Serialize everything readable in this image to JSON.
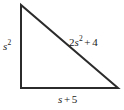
{
  "figure": {
    "kind": "right-triangle-diagram",
    "width": 124,
    "height": 110,
    "background_color": "#ffffff",
    "stroke_color": "#2b2b2b",
    "stroke_width": 2,
    "vertices": {
      "top": [
        21,
        5
      ],
      "bottom_left": [
        21,
        88
      ],
      "bottom_right": [
        118,
        88
      ]
    },
    "right_angle_at": "bottom_left"
  },
  "labels": {
    "left_leg": {
      "text": "s2",
      "coefficient": "",
      "variable": "s",
      "exponent": "2",
      "operator": "",
      "constant": "",
      "position": "left-of-vertical-leg"
    },
    "hypotenuse": {
      "text": "2s2 + 4",
      "coefficient": "2",
      "variable": "s",
      "exponent": "2",
      "operator": "+",
      "constant": "4",
      "position": "above-right-of-hypotenuse"
    },
    "base": {
      "text": "s + 5",
      "coefficient": "",
      "variable": "s",
      "exponent": "",
      "operator": "+",
      "constant": "5",
      "position": "below-base"
    }
  }
}
